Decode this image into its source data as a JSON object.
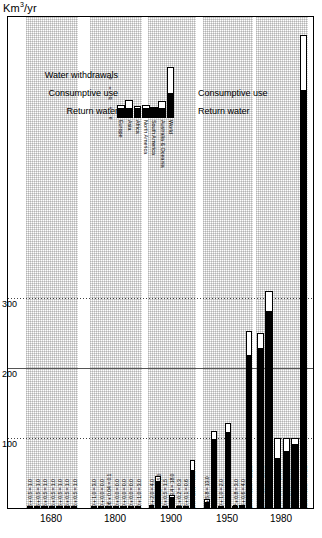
{
  "chart_data": {
    "type": "bar",
    "title": "",
    "ylabel": "Km3/yr",
    "ylabel_display": "Km³/yr",
    "xlabel": "",
    "ylim": [
      0,
      700
    ],
    "grid": true,
    "gridlines": [
      100,
      200,
      300
    ],
    "ytick_labels": [
      "100",
      "200",
      "300"
    ],
    "categories": [
      "1680",
      "1800",
      "1900",
      "1950",
      "1980"
    ],
    "note": "Stacked bars: black = Return water (lower), white = Consumptive use (upper). Label format 'return + consumptive = total'.",
    "legend": {
      "entries": [
        {
          "name": "Water withdrawals",
          "swatch": "total"
        },
        {
          "name": "Consumptive use",
          "swatch": "white"
        },
        {
          "name": "Return water",
          "swatch": "black"
        }
      ],
      "position": "inside-top-left"
    },
    "series": [
      {
        "name": "Return water",
        "color": "#000000"
      },
      {
        "name": "Consumptive use",
        "color": "#ffffff"
      }
    ],
    "groups": [
      {
        "year": "1680",
        "bars": [
          {
            "region": "Europe",
            "return": 0.5,
            "consumptive": 0.5,
            "total": 1.0,
            "label": "0.5 + 0.5 = 1.0"
          },
          {
            "region": "Asia",
            "return": 0.5,
            "consumptive": 0.5,
            "total": 1.0,
            "label": "0.5 + 0.5 = 1.0"
          },
          {
            "region": "Africa",
            "return": 0.5,
            "consumptive": 0.5,
            "total": 1.0,
            "label": "0.5 + 0.5 = 1.0"
          },
          {
            "region": "North America",
            "return": 0.5,
            "consumptive": 0.5,
            "total": 1.0,
            "label": "0.5 + 0.5 = 1.0"
          },
          {
            "region": "South America",
            "return": 0.5,
            "consumptive": 0.5,
            "total": 1.0,
            "label": "0.5 + 0.5 = 1.0"
          },
          {
            "region": "Australia & Oceania",
            "return": 0.5,
            "consumptive": 0.5,
            "total": 1.0,
            "label": "0.5 + 0.5 = 1.0"
          },
          {
            "region": "World",
            "return": 0.5,
            "consumptive": 0.5,
            "total": 1.0,
            "label": "0.5 + 0.5 = 1.0"
          }
        ]
      },
      {
        "year": "1800",
        "bars": [
          {
            "region": "Europe",
            "return": 2.0,
            "consumptive": 1.0,
            "total": 3.0,
            "label": "2.0 + 1.0 = 3.0"
          },
          {
            "region": "Asia",
            "return": 0.0,
            "consumptive": 0.0,
            "total": 0.0,
            "label": "0.0 + 0.0 = 0.0"
          },
          {
            "region": "Africa",
            "return": 0.06,
            "consumptive": 0.04,
            "total": 0.1,
            "label": "0.06 + 0.04 = 0.1"
          },
          {
            "region": "North America",
            "return": 0.0,
            "consumptive": 0.0,
            "total": 0.0,
            "label": "0.0 + 0.0 = 0.0"
          },
          {
            "region": "South America",
            "return": 0.0,
            "consumptive": 0.0,
            "total": 0.0,
            "label": "0.0 + 0.0 = 0.0"
          },
          {
            "region": "Australia & Oceania",
            "return": 0.0,
            "consumptive": 0.0,
            "total": 0.0,
            "label": "0.0 + 0.0 = 0.0"
          },
          {
            "region": "World",
            "return": 2.0,
            "consumptive": 1.0,
            "total": 3.0,
            "label": "2.0 + 1.0 = 3.0"
          }
        ]
      },
      {
        "year": "1900",
        "bars": [
          {
            "region": "Europe",
            "return": 2.0,
            "consumptive": 2.0,
            "total": 4.0,
            "label": "2.0 + 2.0 = 4.0"
          },
          {
            "region": "Asia",
            "return": 36.9,
            "consumptive": 8.1,
            "total": 45.0,
            "label": "36.9 + 8.1 = 45.0"
          },
          {
            "region": "Africa",
            "return": 1.0,
            "consumptive": 0.5,
            "total": 1.5,
            "label": "1.0 + 0.5 = 1.5"
          },
          {
            "region": "North America",
            "return": 14.6,
            "consumptive": 3.4,
            "total": 18.0,
            "label": "14.6 + 3.4 = 18.0"
          },
          {
            "region": "South America",
            "return": 0.1,
            "consumptive": 0.2,
            "total": 0.3,
            "label": "0.1 + 0.2 = 0.3"
          },
          {
            "region": "Australia & Oceania",
            "return": 0.5,
            "consumptive": 0.1,
            "total": 0.6,
            "label": "0.5 + 0.1 = 0.6"
          },
          {
            "region": "World",
            "return": 53.0,
            "consumptive": 15.0,
            "total": 68.0,
            "label": "53.0 + 15.0 = 68.0"
          }
        ]
      },
      {
        "year": "1950",
        "bars": [
          {
            "region": "Europe",
            "return": 7.2,
            "consumptive": 5.8,
            "total": 13.0,
            "label": "7.2 + 5.8 = 13.0"
          },
          {
            "region": "Asia",
            "return": 96.8,
            "consumptive": 13.2,
            "total": 110.0,
            "label": "96.8 + 13.2 = 110.0"
          },
          {
            "region": "Africa",
            "return": 1.0,
            "consumptive": 1.0,
            "total": 2.0,
            "label": "1.0 + 1.0 = 2.0"
          },
          {
            "region": "North America",
            "return": 107.0,
            "consumptive": 13.2,
            "total": 121.0,
            "label": "107.0 + 13.2 = 121.0"
          },
          {
            "region": "South America",
            "return": 2.2,
            "consumptive": 0.8,
            "total": 3.0,
            "label": "2.2 + 0.8 = 3.0"
          },
          {
            "region": "Australia & Oceania",
            "return": 1.4,
            "consumptive": 0.6,
            "total": 4.0,
            "label": "1.4 + 0.6 = 4.0"
          },
          {
            "region": "World",
            "return": 217.0,
            "consumptive": 35.0,
            "total": 252.0,
            "label": "217.0 + 35.0 = 252.0"
          }
        ]
      },
      {
        "year": "1980",
        "bars": [
          {
            "region": "Europe",
            "return": 227.0,
            "consumptive": 23.0,
            "total": 250.0,
            "label": "227.0 + 23.0 = 250.0"
          },
          {
            "region": "Asia",
            "return": 280.0,
            "consumptive": 30.0,
            "total": 310.0,
            "label": "280.0 + 30.0 = 310.0"
          },
          {
            "region": "Africa",
            "return": 70.0,
            "consumptive": 30.0,
            "total": 100.0,
            "label": "70.0 + 30.0 = 100.0"
          },
          {
            "region": "North America",
            "return": 80.0,
            "consumptive": 20.0,
            "total": 100.0,
            "label": "80.0 + 20.0 = 100.0"
          },
          {
            "region": "South America",
            "return": 90.0,
            "consumptive": 10.0,
            "total": 100.0,
            "label": "90.0 + 10.0 = 100.0"
          },
          {
            "region": "Australia & Oceania",
            "return": 595.0,
            "consumptive": 80.0,
            "total": 675.0,
            "label": "595.0 + 80.0 = 675.0"
          }
        ]
      }
    ],
    "inset": {
      "title": "",
      "ytick_labels": [
        "a",
        "+",
        "b",
        "=",
        "c"
      ],
      "categories": [
        "Europe",
        "Asia",
        "Africa",
        "North America",
        "South America",
        "Australia & Oceania",
        "World"
      ],
      "values": [
        {
          "region": "Europe",
          "return": 10,
          "consumptive": 4
        },
        {
          "region": "Asia",
          "return": 10,
          "consumptive": 9
        },
        {
          "region": "Africa",
          "return": 10,
          "consumptive": 3
        },
        {
          "region": "North America",
          "return": 10,
          "consumptive": 4
        },
        {
          "region": "South America",
          "return": 10,
          "consumptive": 2
        },
        {
          "region": "Australia & Oceania",
          "return": 10,
          "consumptive": 8
        },
        {
          "region": "World",
          "return": 26,
          "consumptive": 29
        }
      ]
    }
  },
  "colors": {
    "return_water": "#000000",
    "consumptive_use": "#ffffff",
    "outline": "#000000",
    "band": "#d8d8d8"
  }
}
